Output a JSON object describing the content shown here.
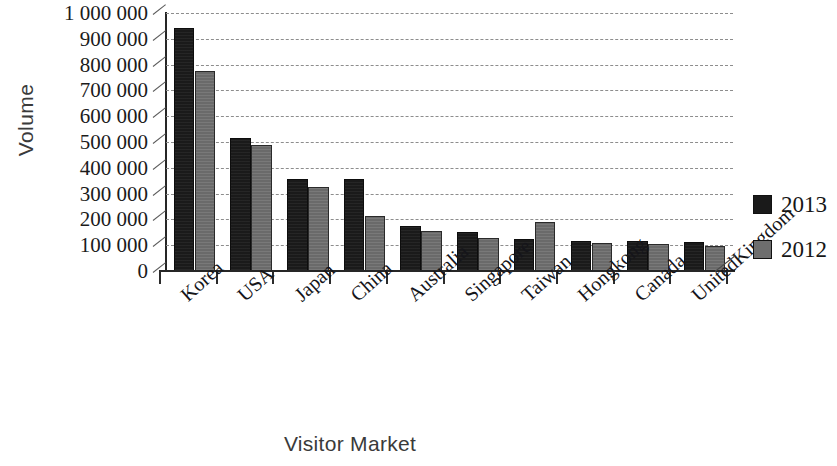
{
  "chart_data": {
    "type": "bar",
    "title": "",
    "xlabel": "Visitor Market",
    "ylabel": "Volume",
    "categories": [
      "Korea",
      "USA",
      "Japan",
      "China",
      "Australia",
      "Singapore",
      "Taiwan",
      "Hongkong",
      "Canada",
      "UnitedKingdom"
    ],
    "series": [
      {
        "name": "2013",
        "color": "#1a1a1a",
        "values": [
          940000,
          515000,
          355000,
          355000,
          175000,
          152000,
          123000,
          118000,
          118000,
          113000
        ]
      },
      {
        "name": "2012",
        "color": "#6e6e6e",
        "values": [
          775000,
          490000,
          325000,
          215000,
          155000,
          128000,
          190000,
          110000,
          103000,
          98000
        ]
      }
    ],
    "ylim": [
      0,
      1000000
    ],
    "ytick_values": [
      0,
      100000,
      200000,
      300000,
      400000,
      500000,
      600000,
      700000,
      800000,
      900000,
      1000000
    ],
    "ytick_labels": [
      "0",
      "100 000",
      "200 000",
      "300 000",
      "400 000",
      "500 000",
      "600 000",
      "700 000",
      "800 000",
      "900 000",
      "1 000 000"
    ],
    "grid": true,
    "grid_axis": "y",
    "legend_position": "right"
  }
}
